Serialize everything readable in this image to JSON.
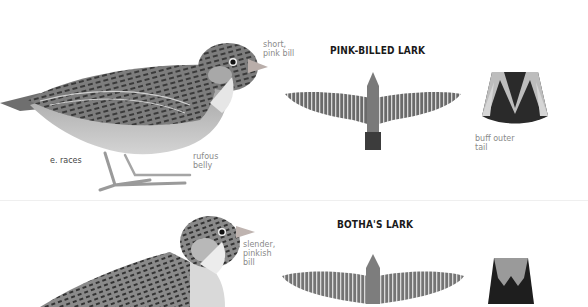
{
  "plates": [
    {
      "species": "PINK-BILLED LARK",
      "annotations": {
        "bill": "short,\npink bill",
        "bill_lines": [
          "short,",
          "pink bill"
        ],
        "race": "e. races",
        "belly_lines": [
          "rufous",
          "belly"
        ],
        "tail_lines": [
          "buff outer",
          "tail"
        ]
      },
      "figures": [
        "perched-side-view",
        "flight-top-view",
        "tail-spread"
      ]
    },
    {
      "species": "BOTHA'S LARK",
      "annotations": {
        "bill_lines": [
          "slender,",
          "pinkish",
          "bill"
        ]
      },
      "figures": [
        "perched-side-view",
        "flight-top-view",
        "tail-spread"
      ]
    }
  ],
  "colors": {
    "background": "#ffffff",
    "title": "#1a1a1a",
    "annotation": "#8a8a8a",
    "bill_pink": "#c9b6b0"
  }
}
